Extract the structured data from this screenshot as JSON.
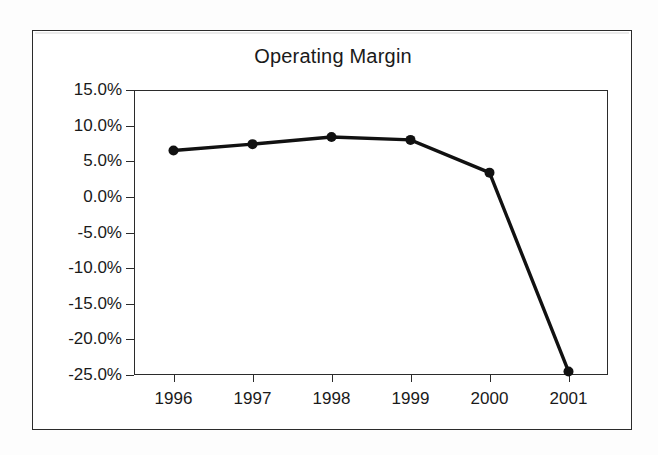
{
  "figure": {
    "title": "Operating Margin",
    "background_color": "#ffffff",
    "frame_color": "#2b2b2b",
    "series_color": "#111111"
  },
  "chart_data": {
    "type": "line",
    "title": "Operating Margin",
    "xlabel": "",
    "ylabel": "",
    "categories": [
      "1996",
      "1997",
      "1998",
      "1999",
      "2000",
      "2001"
    ],
    "x": [
      1996,
      1997,
      1998,
      1999,
      2000,
      2001
    ],
    "values": [
      6.5,
      7.4,
      8.4,
      8.0,
      3.4,
      -24.5
    ],
    "value_labels": [
      "6.5%",
      "7.4%",
      "8.4%",
      "8.0%",
      "3.4%",
      "-24.5%"
    ],
    "unit": "percent",
    "ylim": [
      -25.0,
      15.0
    ],
    "ytick_values": [
      15.0,
      10.0,
      5.0,
      0.0,
      -5.0,
      -10.0,
      -15.0,
      -20.0,
      -25.0
    ],
    "ytick_labels": [
      "15.0%",
      "10.0%",
      "5.0%",
      "0.0%",
      "-5.0%",
      "-10.0%",
      "-15.0%",
      "-20.0%",
      "-25.0%"
    ],
    "xtick_labels": [
      "1996",
      "1997",
      "1998",
      "1999",
      "2000",
      "2001"
    ],
    "grid": false,
    "legend": false,
    "marker": "filled-circle",
    "series": [
      {
        "name": "Operating Margin",
        "values": [
          6.5,
          7.4,
          8.4,
          8.0,
          3.4,
          -24.5
        ]
      }
    ]
  }
}
